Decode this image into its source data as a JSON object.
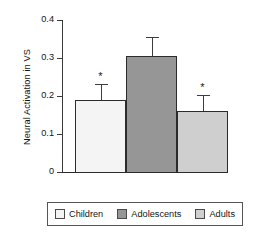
{
  "chart_data": {
    "type": "bar",
    "title": "",
    "xlabel": "",
    "ylabel": "Neural Activation in VS",
    "categories": [
      "Children",
      "Adolescents",
      "Adults"
    ],
    "values": [
      0.19,
      0.305,
      0.16
    ],
    "errors": [
      0.042,
      0.05,
      0.043
    ],
    "error_type": "standard error",
    "annotations": [
      "*",
      "",
      "*"
    ],
    "ylim": [
      0,
      0.4
    ],
    "yticks": [
      0,
      0.1,
      0.2,
      0.3,
      0.4
    ],
    "ytick_labels": [
      "0",
      "0.1",
      "0.2",
      "0.3",
      "0.4"
    ],
    "xtick_labels": [],
    "grid": false,
    "legend_position": "bottom",
    "colors": [
      "#f4f4f4",
      "#969696",
      "#cfcfcf"
    ],
    "edge_color": "#2b2b2b"
  },
  "axis": {
    "y_title": "Neural Activation in VS",
    "ticks": [
      {
        "label": "0.4",
        "value": 0.4
      },
      {
        "label": "0.3",
        "value": 0.3
      },
      {
        "label": "0.2",
        "value": 0.2
      },
      {
        "label": "0.1",
        "value": 0.1
      },
      {
        "label": "0",
        "value": 0
      }
    ]
  },
  "bars": [
    {
      "name": "Children",
      "value": 0.19,
      "error": 0.042,
      "star": "*",
      "color": "#f4f4f4"
    },
    {
      "name": "Adolescents",
      "value": 0.305,
      "error": 0.05,
      "star": "",
      "color": "#969696"
    },
    {
      "name": "Adults",
      "value": 0.16,
      "error": 0.043,
      "star": "*",
      "color": "#cfcfcf"
    }
  ],
  "legend": {
    "entries": [
      {
        "label": "Children",
        "color": "#f4f4f4"
      },
      {
        "label": "Adolescents",
        "color": "#969696"
      },
      {
        "label": "Adults",
        "color": "#cfcfcf"
      }
    ]
  }
}
